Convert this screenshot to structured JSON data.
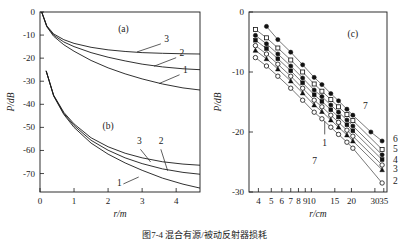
{
  "figure": {
    "caption": "图7-4  混合有源/被动反射器损耗",
    "panels": [
      "a",
      "b",
      "c"
    ]
  },
  "chart_data": [
    {
      "type": "line",
      "panel": "a",
      "title": "(a)",
      "xlabel": "r/m",
      "ylabel": "P/dB",
      "xlim": [
        0,
        4.7
      ],
      "ylim": [
        -78,
        0
      ],
      "xticks": [
        0,
        1,
        2,
        3,
        4
      ],
      "yticks": [
        0,
        -10,
        -20,
        -30,
        -40,
        -50,
        -60,
        -70
      ],
      "grid": false,
      "series": [
        {
          "name": "3",
          "label": "3",
          "x": [
            0.05,
            0.2,
            0.4,
            0.7,
            1.0,
            1.5,
            2.0,
            2.5,
            3.0,
            3.6,
            4.2,
            4.7
          ],
          "y": [
            0.0,
            -6.0,
            -9.5,
            -12.0,
            -13.6,
            -15.3,
            -16.4,
            -17.1,
            -17.6,
            -17.9,
            -18.1,
            -18.2
          ]
        },
        {
          "name": "2",
          "label": "2",
          "x": [
            0.05,
            0.2,
            0.4,
            0.7,
            1.0,
            1.5,
            2.0,
            2.5,
            3.0,
            3.6,
            4.2,
            4.7
          ],
          "y": [
            0.0,
            -6.2,
            -10.0,
            -13.0,
            -15.0,
            -17.6,
            -19.6,
            -21.2,
            -22.6,
            -23.8,
            -24.6,
            -25.0
          ]
        },
        {
          "name": "1",
          "label": "1",
          "x": [
            0.05,
            0.2,
            0.4,
            0.7,
            1.0,
            1.5,
            2.0,
            2.5,
            3.0,
            3.6,
            4.2,
            4.7
          ],
          "y": [
            0.0,
            -6.4,
            -10.5,
            -14.2,
            -17.0,
            -21.0,
            -24.2,
            -26.8,
            -29.0,
            -31.2,
            -32.9,
            -33.8
          ]
        }
      ]
    },
    {
      "type": "line",
      "panel": "b",
      "title": "(b)",
      "xlabel": "r/m",
      "ylabel": "P/dB",
      "xlim": [
        0,
        4.7
      ],
      "ylim": [
        -78,
        0
      ],
      "grid": false,
      "series": [
        {
          "name": "3",
          "label": "3",
          "x": [
            0.18,
            0.4,
            0.7,
            1.0,
            1.5,
            2.0,
            2.5,
            3.0,
            3.6,
            4.2,
            4.7
          ],
          "y": [
            -25.5,
            -36.0,
            -43.5,
            -48.5,
            -54.5,
            -58.4,
            -61.2,
            -63.2,
            -64.9,
            -65.9,
            -66.4
          ]
        },
        {
          "name": "2",
          "label": "2",
          "x": [
            0.18,
            0.4,
            0.7,
            1.0,
            1.5,
            2.0,
            2.5,
            3.0,
            3.6,
            4.2,
            4.7
          ],
          "y": [
            -25.5,
            -36.2,
            -44.0,
            -49.2,
            -55.6,
            -59.9,
            -63.2,
            -65.7,
            -68.0,
            -69.5,
            -70.3
          ]
        },
        {
          "name": "1",
          "label": "1",
          "x": [
            0.18,
            0.4,
            0.7,
            1.0,
            1.5,
            2.0,
            2.5,
            3.0,
            3.6,
            4.2,
            4.7
          ],
          "y": [
            -25.5,
            -36.4,
            -44.4,
            -50.0,
            -56.8,
            -61.6,
            -65.4,
            -68.6,
            -72.0,
            -74.6,
            -76.3
          ]
        }
      ]
    },
    {
      "type": "scatter",
      "panel": "c",
      "title": "(c)",
      "xlabel": "r/cm",
      "ylabel": "P/dB",
      "xscale": "log",
      "xlim": [
        3.4,
        37
      ],
      "ylim": [
        -30,
        0
      ],
      "xticks": [
        4,
        5,
        6,
        7,
        8,
        9,
        10,
        15,
        20,
        30,
        35
      ],
      "yticks": [
        0,
        -10,
        -20,
        -30
      ],
      "grid": false,
      "annotations": [
        "7",
        "1",
        "7"
      ],
      "series": [
        {
          "name": "7",
          "label": "7",
          "marker": "filled-circle",
          "x": [
            4.6,
            5.6,
            7.0,
            8.6,
            10.5,
            12.0,
            14.0,
            16.0,
            18.5,
            20.5,
            28.0,
            34.0
          ],
          "y": [
            -2.4,
            -4.6,
            -6.7,
            -8.8,
            -10.9,
            -12.1,
            -13.6,
            -14.8,
            -16.2,
            -17.2,
            -20.0,
            -21.5
          ]
        },
        {
          "name": "6",
          "label": "6",
          "marker": "open-square",
          "x": [
            3.8,
            4.6,
            5.6,
            7.0,
            8.6,
            10.5,
            12.0,
            14.0,
            16.0,
            18.5,
            20.5,
            34.0
          ],
          "y": [
            -2.9,
            -4.3,
            -6.0,
            -8.0,
            -10.0,
            -12.0,
            -13.2,
            -14.6,
            -15.8,
            -17.1,
            -18.1,
            -22.9
          ]
        },
        {
          "name": "5",
          "label": "5",
          "marker": "filled-circle",
          "x": [
            3.8,
            4.6,
            5.6,
            7.0,
            8.6,
            10.5,
            12.0,
            14.0,
            16.0,
            18.5,
            20.5,
            34.0
          ],
          "y": [
            -3.9,
            -5.3,
            -7.0,
            -9.0,
            -11.0,
            -13.0,
            -14.1,
            -15.5,
            -16.7,
            -18.0,
            -19.0,
            -23.8
          ]
        },
        {
          "name": "4",
          "label": "4",
          "marker": "filled-square",
          "x": [
            3.8,
            4.6,
            5.6,
            7.0,
            8.6,
            10.5,
            12.0,
            14.0,
            16.0,
            18.5,
            20.5,
            34.0
          ],
          "y": [
            -4.7,
            -6.1,
            -7.8,
            -9.8,
            -11.8,
            -13.8,
            -14.9,
            -16.3,
            -17.5,
            -18.8,
            -19.8,
            -24.6
          ]
        },
        {
          "name": "3",
          "label": "3",
          "marker": "open-circle",
          "x": [
            3.8,
            4.6,
            5.6,
            7.0,
            8.6,
            10.5,
            12.0,
            14.0,
            16.0,
            18.5,
            20.5,
            34.0
          ],
          "y": [
            -5.6,
            -7.0,
            -8.7,
            -10.7,
            -12.7,
            -14.7,
            -15.8,
            -17.2,
            -18.4,
            -19.7,
            -20.7,
            -25.5
          ]
        },
        {
          "name": "2",
          "label": "2",
          "marker": "filled-triangle",
          "x": [
            3.8,
            4.6,
            5.6,
            7.0,
            8.6,
            10.5,
            12.0,
            14.0,
            16.0,
            18.5,
            20.5,
            34.0
          ],
          "y": [
            -6.4,
            -7.8,
            -9.5,
            -11.5,
            -13.5,
            -15.5,
            -16.6,
            -18.0,
            -19.2,
            -20.5,
            -21.5,
            -26.3
          ]
        },
        {
          "name": "1",
          "label": "1",
          "marker": "open-circle",
          "x": [
            3.8,
            4.6,
            5.6,
            7.0,
            8.6,
            10.5,
            12.0,
            14.0,
            16.0,
            18.5,
            20.5,
            34.0
          ],
          "y": [
            -7.6,
            -9.0,
            -10.7,
            -12.7,
            -14.7,
            -16.7,
            -17.8,
            -19.2,
            -20.4,
            -21.7,
            -22.7,
            -28.5
          ]
        }
      ]
    }
  ],
  "left_panel": {
    "ylabel": "P/dB",
    "xlabel": "r/m",
    "yticks": [
      "0",
      "-10",
      "-20",
      "-30",
      "-40",
      "-50",
      "-60",
      "-70"
    ],
    "xticks": [
      "0",
      "1",
      "2",
      "3",
      "4"
    ],
    "label_a": "(a)",
    "label_b": "(b)",
    "curve_labels_a": [
      "3",
      "2",
      "1"
    ],
    "curve_labels_b": [
      "3",
      "2",
      "1"
    ]
  },
  "right_panel": {
    "ylabel": "P/dB",
    "xlabel": "r/cm",
    "yticks": [
      "0",
      "-10",
      "-20",
      "-30"
    ],
    "xticks": [
      "4",
      "5",
      "6",
      "7",
      "8",
      "9",
      "10",
      "15",
      "20",
      "30",
      "35"
    ],
    "label_c": "(c)",
    "edge_labels": [
      "7",
      "6",
      "5",
      "4",
      "3",
      "2"
    ],
    "inner_labels": [
      "1",
      "7"
    ]
  }
}
